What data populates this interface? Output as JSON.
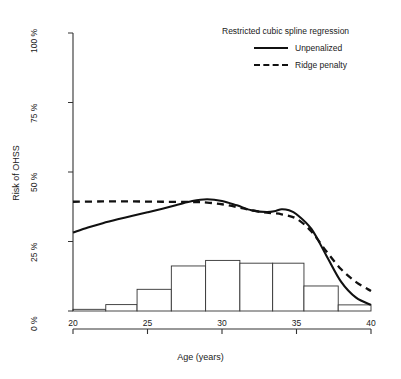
{
  "chart_data": {
    "type": "line",
    "title": "",
    "xlabel": "Age (years)",
    "ylabel": "Risk of OHSS",
    "xlim": [
      20,
      40
    ],
    "ylim": [
      0,
      100
    ],
    "xticks": [
      20,
      25,
      30,
      35,
      40
    ],
    "xtick_labels": [
      "20",
      "25",
      "30",
      "35",
      "40"
    ],
    "yticks": [
      0,
      25,
      50,
      75,
      100
    ],
    "ytick_labels": [
      "0 %",
      "25 %",
      "50 %",
      "75 %",
      "100 %"
    ],
    "grid": false,
    "legend_position": "top-right",
    "legend_title": "Restricted cubic spline regression",
    "series": [
      {
        "name": "Unpenalized",
        "style": "solid",
        "color": "#111111",
        "x": [
          20,
          21,
          22,
          23,
          24,
          25,
          26,
          27,
          28,
          29,
          30,
          31,
          32,
          33,
          33.6,
          34,
          34.5,
          35,
          36,
          37,
          38,
          39,
          40
        ],
        "values": [
          28.2,
          30.0,
          31.6,
          33.0,
          34.3,
          35.5,
          36.8,
          38.2,
          39.6,
          40.2,
          39.6,
          38.0,
          36.2,
          35.6,
          36.0,
          36.6,
          36.2,
          34.8,
          29.5,
          20.0,
          10.5,
          4.8,
          2.2
        ]
      },
      {
        "name": "Ridge penalty",
        "style": "dashed",
        "color": "#111111",
        "x": [
          20,
          22,
          24,
          26,
          28,
          29,
          30,
          31,
          32,
          33,
          34,
          35,
          36,
          37,
          38,
          39,
          40
        ],
        "values": [
          39.3,
          39.4,
          39.4,
          39.3,
          39.2,
          39.0,
          38.4,
          37.4,
          36.2,
          35.4,
          34.8,
          33.2,
          28.6,
          21.5,
          15.0,
          10.4,
          7.2
        ]
      }
    ],
    "histogram": {
      "name": "Age distribution",
      "bin_edges": [
        20,
        22.2,
        24.3,
        26.6,
        28.9,
        31.2,
        33.4,
        35.5,
        37.8,
        40
      ],
      "values": [
        0.6,
        2.3,
        7.8,
        16.2,
        18.2,
        17.2,
        17.2,
        9.0,
        2.2
      ],
      "fill": "#ffffff",
      "stroke": "#333333"
    }
  },
  "legend": {
    "title": "Restricted cubic spline regression",
    "items": [
      {
        "label": "Unpenalized",
        "style": "solid"
      },
      {
        "label": "Ridge penalty",
        "style": "dashed"
      }
    ]
  },
  "axes": {
    "x_title": "Age (years)",
    "y_title": "Risk of OHSS"
  }
}
